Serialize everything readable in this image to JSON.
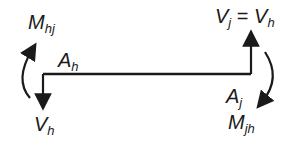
{
  "diagram": {
    "type": "beam-free-body-diagram",
    "labels": {
      "moment_left": {
        "base": "M",
        "sub": "hj"
      },
      "node_left": {
        "base": "A",
        "sub": "h"
      },
      "shear_left": {
        "base": "V",
        "sub": "h"
      },
      "shear_right": {
        "base": "V",
        "sub": "j",
        "eq": " = ",
        "base2": "V",
        "sub2": "h"
      },
      "node_right": {
        "base": "A",
        "sub": "j"
      },
      "moment_right": {
        "base": "M",
        "sub": "jh"
      }
    },
    "colors": {
      "stroke": "#1a1a1a",
      "background": "#ffffff"
    }
  }
}
